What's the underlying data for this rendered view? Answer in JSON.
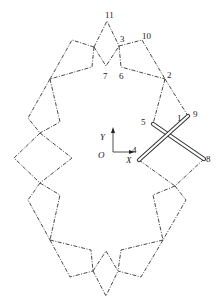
{
  "figure": {
    "type": "linkage-mechanism-diagram",
    "line_style": "dash-dot",
    "colors": {
      "lines": "#333333",
      "bars_fill": "#ffffff",
      "text": "#222222"
    }
  },
  "labels": {
    "n1": "1",
    "n2": "2",
    "n3": "3",
    "n4": "4",
    "n5": "5",
    "n6": "6",
    "n7": "7",
    "n8": "8",
    "n9": "9",
    "n10": "10",
    "n11": "11"
  },
  "axes": {
    "origin": "O",
    "x": "X",
    "y": "Y"
  }
}
